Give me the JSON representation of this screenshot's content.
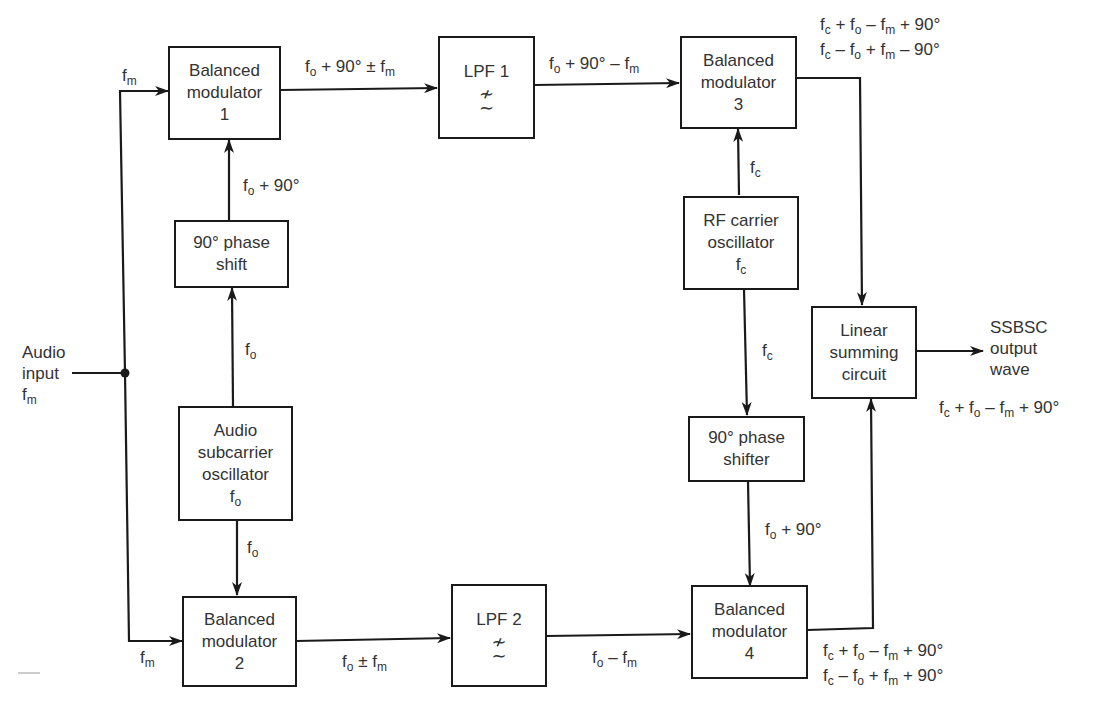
{
  "blocks": {
    "bm1": {
      "line1": "Balanced",
      "line2": "modulator",
      "line3": "1"
    },
    "phase_shift": {
      "line1": "90° phase",
      "line2": "shift"
    },
    "audio_osc": {
      "line1": "Audio",
      "line2": "subcarrier",
      "line3": "oscillator",
      "var": "f",
      "sub": "o"
    },
    "bm2": {
      "line1": "Balanced",
      "line2": "modulator",
      "line3": "2"
    },
    "lpf1": {
      "label": "LPF 1",
      "symbol": "≁\n∼"
    },
    "lpf2": {
      "label": "LPF 2",
      "symbol": "≁\n∼"
    },
    "bm3": {
      "line1": "Balanced",
      "line2": "modulator",
      "line3": "3"
    },
    "rf_osc": {
      "line1": "RF carrier",
      "line2": "oscillator",
      "var": "f",
      "sub": "c"
    },
    "phase_shifter": {
      "line1": "90° phase",
      "line2": "shifter"
    },
    "bm4": {
      "line1": "Balanced",
      "line2": "modulator",
      "line3": "4"
    },
    "summer": {
      "line1": "Linear",
      "line2": "summing",
      "line3": "circuit"
    }
  },
  "labels": {
    "audio_input": {
      "line1": "Audio",
      "line2": "input",
      "var": "f",
      "sub": "m"
    },
    "fm_top": {
      "var": "f",
      "sub": "m"
    },
    "fm_bottom": {
      "var": "f",
      "sub": "m"
    },
    "bm1_out": {
      "a": "f",
      "a_sub": "o",
      "b": " + 90° ± f",
      "b_sub": "m"
    },
    "lpf1_out": {
      "a": "f",
      "a_sub": "o",
      "b": " + 90° – f",
      "b_sub": "m"
    },
    "phase_out": {
      "a": "f",
      "a_sub": "o",
      "b": " + 90°"
    },
    "osc_up": {
      "a": "f",
      "a_sub": "o"
    },
    "osc_down": {
      "a": "f",
      "a_sub": "o"
    },
    "bm2_out": {
      "a": "f",
      "a_sub": "o",
      "b": " ± f",
      "b_sub": "m"
    },
    "lpf2_out": {
      "a": "f",
      "a_sub": "o",
      "b": " – f",
      "b_sub": "m"
    },
    "rf_up": {
      "a": "f",
      "a_sub": "c"
    },
    "rf_down": {
      "a": "f",
      "a_sub": "c"
    },
    "shifter_out": {
      "a": "f",
      "a_sub": "o",
      "b": " + 90°"
    },
    "bm3_out_1": {
      "p1": "f",
      "s1": "c",
      "p2": " + f",
      "s2": "o",
      "p3": " – f",
      "s3": "m",
      "p4": " + 90°"
    },
    "bm3_out_2": {
      "p1": "f",
      "s1": "c",
      "p2": " – f",
      "s2": "o",
      "p3": " + f",
      "s3": "m",
      "p4": " – 90°"
    },
    "bm4_out_1": {
      "p1": "f",
      "s1": "c",
      "p2": " + f",
      "s2": "o",
      "p3": " – f",
      "s3": "m",
      "p4": " + 90°"
    },
    "bm4_out_2": {
      "p1": "f",
      "s1": "c",
      "p2": " – f",
      "s2": "o",
      "p3": " + f",
      "s3": "m",
      "p4": " + 90°"
    },
    "output": {
      "line1": "SSBSC",
      "line2": "output",
      "line3": "wave"
    },
    "output_eq": {
      "p1": "f",
      "s1": "c",
      "p2": " + f",
      "s2": "o",
      "p3": " – f",
      "s3": "m",
      "p4": " + 90°"
    }
  },
  "colors": {
    "line": "#1a1a1a",
    "text": "#333333",
    "background": "#ffffff"
  }
}
